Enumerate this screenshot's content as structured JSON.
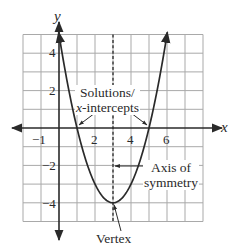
{
  "chart_data": {
    "type": "line",
    "title": "",
    "function": "y = x^2 - 6x + 5",
    "xlabel": "x",
    "ylabel": "y",
    "xlim": [
      -2,
      8
    ],
    "ylim": [
      -5,
      5
    ],
    "grid": true,
    "grid_step": 1,
    "x_tick_labels": [
      "-1",
      "2",
      "4",
      "6"
    ],
    "y_tick_labels": [
      "4",
      "2",
      "-2",
      "-4"
    ],
    "x_ticks": [
      -1,
      2,
      4,
      6
    ],
    "y_ticks": [
      4,
      2,
      -2,
      -4
    ],
    "series": [
      {
        "name": "parabola",
        "x": [
          0,
          0.5,
          1,
          1.5,
          2,
          2.5,
          3,
          3.5,
          4,
          4.5,
          5,
          5.5,
          6
        ],
        "y": [
          5,
          2.25,
          0,
          -1.75,
          -3,
          -3.75,
          -4,
          -3.75,
          -3,
          -1.75,
          0,
          2.25,
          5
        ]
      }
    ],
    "axis_of_symmetry": {
      "x": 3,
      "style": "dashed"
    },
    "vertex": {
      "x": 3,
      "y": -4
    },
    "x_intercepts": [
      1,
      5
    ],
    "annotations": [
      {
        "text": "Solutions/ x-intercepts",
        "points_to": [
          [
            1,
            0
          ],
          [
            5,
            0
          ]
        ]
      },
      {
        "text": "Axis of symmetry",
        "points_to": [
          [
            3,
            -2
          ]
        ]
      },
      {
        "text": "Vertex",
        "points_to": [
          [
            3,
            -4
          ]
        ]
      }
    ]
  },
  "labels": {
    "axis_x": "x",
    "axis_y": "y",
    "ticks_x": [
      "−1",
      "2",
      "4",
      "6"
    ],
    "ticks_y": [
      "4",
      "2",
      "−2",
      "−4"
    ],
    "solutions_line1": "Solutions/",
    "solutions_line2_italic": "x",
    "solutions_line2_rest": "-intercepts",
    "axis_sym_line1": "Axis of",
    "axis_sym_line2": "symmetry",
    "vertex": "Vertex"
  },
  "colors": {
    "grid": "#a9a9a9",
    "axis": "#2a2a2a",
    "curve": "#2a2a2a",
    "background": "#ffffff"
  }
}
